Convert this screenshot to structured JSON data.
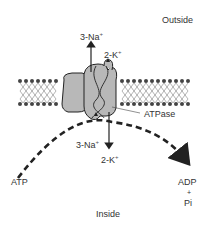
{
  "diagram": {
    "regions": {
      "outside": "Outside",
      "inside": "Inside"
    },
    "enzyme_label": "ATPase",
    "ions": {
      "na_out": {
        "base": "3-Na",
        "charge": "+"
      },
      "k_in_top": {
        "base": "2-K",
        "charge": "+"
      },
      "na_in": {
        "base": "3-Na",
        "charge": "+"
      },
      "k_in_bottom": {
        "base": "2-K",
        "charge": "+"
      }
    },
    "reaction": {
      "substrate": "ATP",
      "product_1": "ADP",
      "plus": "+",
      "product_2": "Pi"
    },
    "colors": {
      "protein_fill": "#b8b8b8",
      "outline": "#222222",
      "lipid_head": "#444444",
      "text": "#333333"
    }
  }
}
